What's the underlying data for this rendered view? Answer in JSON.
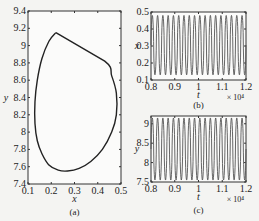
{
  "chart_data": [
    {
      "id": "a",
      "type": "line",
      "subtype": "phase-portrait",
      "caption": "(a)",
      "xlabel": "x",
      "ylabel": "y",
      "xlim": [
        0.1,
        0.5
      ],
      "ylim": [
        7.4,
        9.4
      ],
      "xticks": [
        "0.1",
        "0.2",
        "0.3",
        "0.4",
        "0.5"
      ],
      "yticks": [
        "7.4",
        "7.6",
        "7.8",
        "8",
        "8.2",
        "8.4",
        "8.6",
        "8.8",
        "9",
        "9.2",
        "9.4"
      ],
      "grid": false,
      "series": [
        {
          "name": "limit cycle",
          "x": [
            0.22,
            0.19,
            0.16,
            0.14,
            0.13,
            0.13,
            0.14,
            0.16,
            0.19,
            0.23,
            0.27,
            0.32,
            0.37,
            0.42,
            0.46,
            0.48,
            0.48,
            0.46,
            0.43,
            0.22
          ],
          "y": [
            9.15,
            9.05,
            8.85,
            8.6,
            8.35,
            8.1,
            7.9,
            7.75,
            7.62,
            7.56,
            7.55,
            7.58,
            7.66,
            7.8,
            8.0,
            8.2,
            8.45,
            8.65,
            8.82,
            9.15
          ]
        }
      ]
    },
    {
      "id": "b",
      "type": "line",
      "caption": "(b)",
      "xlabel": "t",
      "ylabel": "x",
      "x_multiplier": "× 10⁴",
      "xlim": [
        0.8,
        1.2
      ],
      "ylim": [
        0.1,
        0.5
      ],
      "xticks": [
        "0.8",
        "0.9",
        "1",
        "1.1",
        "1.2"
      ],
      "yticks": [
        "0.1",
        "0.2",
        "0.3",
        "0.4",
        "0.5"
      ],
      "grid": false,
      "series": [
        {
          "name": "x(t)",
          "periodic": true,
          "min": 0.13,
          "max": 0.48,
          "cycles": 18
        }
      ]
    },
    {
      "id": "c",
      "type": "line",
      "caption": "(c)",
      "xlabel": "t",
      "ylabel": "y",
      "x_multiplier": "× 10⁴",
      "xlim": [
        0.8,
        1.2
      ],
      "ylim": [
        7.5,
        9.2
      ],
      "xticks": [
        "0.8",
        "0.9",
        "1",
        "1.1",
        "1.2"
      ],
      "yticks": [
        "7.5",
        "8",
        "8.5",
        "9"
      ],
      "grid": false,
      "series": [
        {
          "name": "y(t)",
          "periodic": true,
          "min": 7.55,
          "max": 9.15,
          "cycles": 18
        }
      ]
    }
  ]
}
